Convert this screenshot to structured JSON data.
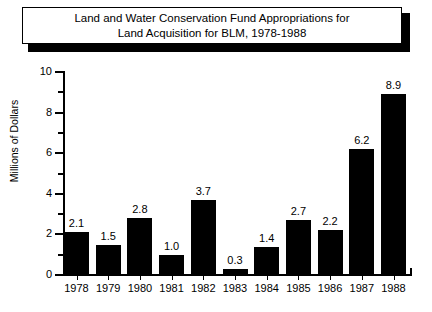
{
  "title": {
    "line1": "Land and Water Conservation Fund Appropriations for",
    "line2": "Land Acquisition for BLM, 1978-1988",
    "full": "Land and Water Conservation Fund Appropriations for\nLand Acquisition for BLM, 1978-1988"
  },
  "axes": {
    "ylabel": "Millions of Dollars",
    "xlabel": "",
    "y_ticks": [
      "0",
      "2",
      "4",
      "6",
      "8",
      "10"
    ],
    "y_minor_ticks": [
      "1",
      "3",
      "5",
      "7",
      "9"
    ],
    "ymin": 0,
    "ymax": 10
  },
  "colors": {
    "bar": "#000000",
    "background": "#ffffff",
    "axis": "#000000",
    "text": "#000000",
    "title_box_border": "#000000",
    "title_box_shadow": "#000000"
  },
  "chart_data": {
    "type": "bar",
    "title": "Land and Water Conservation Fund Appropriations for Land Acquisition for BLM, 1978-1988",
    "xlabel": "",
    "ylabel": "Millions of Dollars",
    "ylim": [
      0,
      10
    ],
    "grid": false,
    "legend": null,
    "categories": [
      "1978",
      "1979",
      "1980",
      "1981",
      "1982",
      "1983",
      "1984",
      "1985",
      "1986",
      "1987",
      "1988"
    ],
    "values": [
      2.1,
      1.5,
      2.8,
      1.0,
      3.7,
      0.3,
      1.4,
      2.7,
      2.2,
      6.2,
      8.9
    ],
    "value_labels": [
      "2.1",
      "1.5",
      "2.8",
      "1.0",
      "3.7",
      "0.3",
      "1.4",
      "2.7",
      "2.2",
      "6.2",
      "8.9"
    ],
    "y_tick_labels": [
      "0",
      "2",
      "4",
      "6",
      "8",
      "10"
    ],
    "y_minor_tick_labels": [
      "1",
      "3",
      "5",
      "7",
      "9"
    ]
  }
}
